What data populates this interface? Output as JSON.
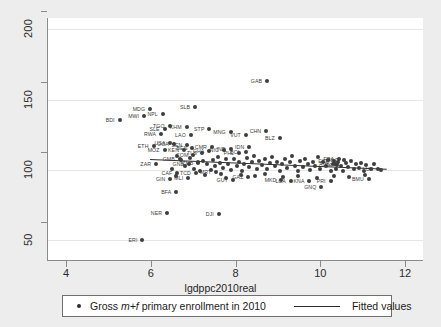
{
  "chart_data": {
    "type": "scatter",
    "title": "",
    "xlabel": "lgdppc2010real",
    "ylabel": "",
    "xlim": [
      3.55,
      12.4
    ],
    "ylim": [
      36,
      208
    ],
    "xticks": [
      4,
      6,
      8,
      10,
      12
    ],
    "yticks": [
      50,
      100,
      150,
      200
    ],
    "grid": "horizontal",
    "legend_position": "bottom",
    "series": [
      {
        "name": "Gross m+f primary enrollment in 2010",
        "marker": "filled-circle",
        "color": "#3d3d3d",
        "points": [
          {
            "label": "GAB",
            "x": 8.72,
            "y": 163.0
          },
          {
            "label": "SLB",
            "x": 7.02,
            "y": 144.5
          },
          {
            "label": "MDG",
            "x": 5.96,
            "y": 143.5
          },
          {
            "label": "NPL",
            "x": 6.26,
            "y": 140.0
          },
          {
            "label": "MWI",
            "x": 5.82,
            "y": 138.5
          },
          {
            "label": "BDI",
            "x": 5.24,
            "y": 135.5
          },
          {
            "label": "TGO",
            "x": 6.42,
            "y": 131.5
          },
          {
            "label": "KHM",
            "x": 6.82,
            "y": 130.5
          },
          {
            "label": "SLE",
            "x": 6.3,
            "y": 129.0
          },
          {
            "label": "STP",
            "x": 7.36,
            "y": 129.0
          },
          {
            "label": "MNG",
            "x": 7.86,
            "y": 127.0
          },
          {
            "label": "CHN",
            "x": 8.7,
            "y": 127.5
          },
          {
            "label": "RWA",
            "x": 6.22,
            "y": 125.5
          },
          {
            "label": "LAO",
            "x": 6.92,
            "y": 125.0
          },
          {
            "label": "VUT",
            "x": 8.22,
            "y": 124.5
          },
          {
            "label": "BLZ",
            "x": 9.02,
            "y": 123.0
          },
          {
            "label": "USA",
            "x": 6.44,
            "y": 119.0
          },
          {
            "label": "UGA",
            "x": 6.52,
            "y": 118.5
          },
          {
            "label": "MOZ",
            "x": 6.3,
            "y": 114.5
          },
          {
            "label": "KEN",
            "x": 6.76,
            "y": 114.0
          },
          {
            "label": "SEN",
            "x": 6.84,
            "y": 117.5
          },
          {
            "label": "ETH",
            "x": 6.04,
            "y": 117.0
          },
          {
            "label": "BEN",
            "x": 6.96,
            "y": 115.5
          },
          {
            "label": "CMR",
            "x": 7.42,
            "y": 116.0
          },
          {
            "label": "GHA",
            "x": 7.36,
            "y": 113.5
          },
          {
            "label": "NIC",
            "x": 7.7,
            "y": 114.5
          },
          {
            "label": "IND",
            "x": 7.86,
            "y": 115.0
          },
          {
            "label": "BOL",
            "x": 8.22,
            "y": 113.0
          },
          {
            "label": "PHL",
            "x": 8.06,
            "y": 112.0
          },
          {
            "label": "IDN",
            "x": 8.3,
            "y": 116.0
          },
          {
            "label": "TLS",
            "x": 7.18,
            "y": 112.0
          },
          {
            "label": "COM",
            "x": 6.98,
            "y": 110.5
          },
          {
            "label": "GMB",
            "x": 6.66,
            "y": 108.0
          },
          {
            "label": "GIN",
            "x": 6.44,
            "y": 93.5
          },
          {
            "label": "BFA",
            "x": 6.58,
            "y": 84.5
          },
          {
            "label": "CAF",
            "x": 6.6,
            "y": 97.5
          },
          {
            "label": "MLI",
            "x": 6.86,
            "y": 94.5
          },
          {
            "label": "ZMB",
            "x": 7.1,
            "y": 105.0
          },
          {
            "label": "ZAR",
            "x": 6.1,
            "y": 104.5
          },
          {
            "label": "TCD",
            "x": 7.04,
            "y": 97.5
          },
          {
            "label": "GNB",
            "x": 6.88,
            "y": 104.0
          },
          {
            "label": "NER",
            "x": 6.36,
            "y": 69.5
          },
          {
            "label": "DJI",
            "x": 7.58,
            "y": 68.5
          },
          {
            "label": "ERI",
            "x": 5.78,
            "y": 50.5
          },
          {
            "label": "MRT",
            "x": 7.52,
            "y": 98.5
          },
          {
            "label": "GUY",
            "x": 7.92,
            "y": 93.0
          },
          {
            "label": "GAZ",
            "x": 8.28,
            "y": 95.0
          },
          {
            "label": "MKD",
            "x": 9.06,
            "y": 93.0
          },
          {
            "label": "LCA",
            "x": 9.28,
            "y": 92.0
          },
          {
            "label": "GNQ",
            "x": 10.0,
            "y": 88.0
          },
          {
            "label": "KNA",
            "x": 9.72,
            "y": 92.5
          },
          {
            "label": "PRI",
            "x": 10.22,
            "y": 92.0
          },
          {
            "label": "BMU",
            "x": 11.12,
            "y": 93.5
          },
          {
            "label": "LUX",
            "x": 11.34,
            "y": 100.5
          },
          {
            "label": "NLD",
            "x": 10.54,
            "y": 107.0
          },
          {
            "label": "FRA",
            "x": 10.42,
            "y": 107.5
          },
          {
            "label": "AUS",
            "x": 10.32,
            "y": 104.5
          },
          {
            "label": "ITA",
            "x": 10.38,
            "y": 103.5
          },
          {
            "label": "ESP",
            "x": 10.3,
            "y": 106.5
          },
          {
            "label": "",
            "x": 7.2,
            "y": 106.5
          },
          {
            "label": "",
            "x": 7.3,
            "y": 104.0
          },
          {
            "label": "",
            "x": 7.44,
            "y": 107.0
          },
          {
            "label": "",
            "x": 7.5,
            "y": 103.0
          },
          {
            "label": "",
            "x": 7.56,
            "y": 109.0
          },
          {
            "label": "",
            "x": 7.62,
            "y": 105.0
          },
          {
            "label": "",
            "x": 7.68,
            "y": 101.5
          },
          {
            "label": "",
            "x": 7.74,
            "y": 108.0
          },
          {
            "label": "",
            "x": 7.8,
            "y": 104.0
          },
          {
            "label": "",
            "x": 7.88,
            "y": 100.0
          },
          {
            "label": "",
            "x": 7.94,
            "y": 107.5
          },
          {
            "label": "",
            "x": 8.0,
            "y": 103.0
          },
          {
            "label": "",
            "x": 8.06,
            "y": 106.0
          },
          {
            "label": "",
            "x": 8.12,
            "y": 99.5
          },
          {
            "label": "",
            "x": 8.18,
            "y": 104.5
          },
          {
            "label": "",
            "x": 8.24,
            "y": 108.5
          },
          {
            "label": "",
            "x": 8.3,
            "y": 102.0
          },
          {
            "label": "",
            "x": 8.36,
            "y": 105.5
          },
          {
            "label": "",
            "x": 8.42,
            "y": 110.0
          },
          {
            "label": "",
            "x": 8.48,
            "y": 101.0
          },
          {
            "label": "",
            "x": 8.54,
            "y": 106.5
          },
          {
            "label": "",
            "x": 8.6,
            "y": 103.5
          },
          {
            "label": "",
            "x": 8.66,
            "y": 108.0
          },
          {
            "label": "",
            "x": 8.72,
            "y": 100.5
          },
          {
            "label": "",
            "x": 8.78,
            "y": 105.0
          },
          {
            "label": "",
            "x": 8.84,
            "y": 109.5
          },
          {
            "label": "",
            "x": 8.9,
            "y": 102.5
          },
          {
            "label": "",
            "x": 8.96,
            "y": 106.0
          },
          {
            "label": "",
            "x": 9.02,
            "y": 99.0
          },
          {
            "label": "",
            "x": 9.08,
            "y": 104.0
          },
          {
            "label": "",
            "x": 9.14,
            "y": 107.5
          },
          {
            "label": "",
            "x": 9.2,
            "y": 101.5
          },
          {
            "label": "",
            "x": 9.26,
            "y": 105.5
          },
          {
            "label": "",
            "x": 9.32,
            "y": 110.0
          },
          {
            "label": "",
            "x": 9.38,
            "y": 103.0
          },
          {
            "label": "",
            "x": 9.44,
            "y": 99.5
          },
          {
            "label": "",
            "x": 9.5,
            "y": 106.5
          },
          {
            "label": "",
            "x": 9.56,
            "y": 102.0
          },
          {
            "label": "",
            "x": 9.62,
            "y": 108.0
          },
          {
            "label": "",
            "x": 9.68,
            "y": 104.5
          },
          {
            "label": "",
            "x": 9.74,
            "y": 100.0
          },
          {
            "label": "",
            "x": 9.8,
            "y": 106.0
          },
          {
            "label": "",
            "x": 9.86,
            "y": 103.0
          },
          {
            "label": "",
            "x": 9.92,
            "y": 109.0
          },
          {
            "label": "",
            "x": 9.98,
            "y": 101.0
          },
          {
            "label": "",
            "x": 10.04,
            "y": 105.5
          },
          {
            "label": "",
            "x": 10.1,
            "y": 102.5
          },
          {
            "label": "",
            "x": 10.16,
            "y": 107.0
          },
          {
            "label": "",
            "x": 10.22,
            "y": 99.5
          },
          {
            "label": "",
            "x": 10.28,
            "y": 104.0
          },
          {
            "label": "",
            "x": 10.34,
            "y": 101.0
          },
          {
            "label": "",
            "x": 10.4,
            "y": 106.0
          },
          {
            "label": "",
            "x": 10.46,
            "y": 103.0
          },
          {
            "label": "",
            "x": 10.52,
            "y": 99.0
          },
          {
            "label": "",
            "x": 10.58,
            "y": 105.0
          },
          {
            "label": "",
            "x": 10.64,
            "y": 102.0
          },
          {
            "label": "",
            "x": 10.7,
            "y": 106.5
          },
          {
            "label": "",
            "x": 10.76,
            "y": 100.5
          },
          {
            "label": "",
            "x": 10.82,
            "y": 104.0
          },
          {
            "label": "",
            "x": 10.88,
            "y": 101.5
          },
          {
            "label": "",
            "x": 10.94,
            "y": 105.0
          },
          {
            "label": "",
            "x": 11.0,
            "y": 99.0
          },
          {
            "label": "",
            "x": 11.06,
            "y": 103.5
          },
          {
            "label": "",
            "x": 11.18,
            "y": 101.0
          },
          {
            "label": "",
            "x": 11.24,
            "y": 104.5
          },
          {
            "label": "",
            "x": 11.42,
            "y": 100.0
          },
          {
            "label": "",
            "x": 6.6,
            "y": 110.0
          },
          {
            "label": "",
            "x": 6.7,
            "y": 107.0
          },
          {
            "label": "",
            "x": 6.78,
            "y": 103.0
          },
          {
            "label": "",
            "x": 6.9,
            "y": 108.5
          },
          {
            "label": "",
            "x": 7.0,
            "y": 101.0
          },
          {
            "label": "",
            "x": 7.08,
            "y": 106.0
          },
          {
            "label": "",
            "x": 6.48,
            "y": 100.5
          },
          {
            "label": "",
            "x": 6.56,
            "y": 96.0
          },
          {
            "label": "",
            "x": 7.14,
            "y": 99.0
          },
          {
            "label": "",
            "x": 7.26,
            "y": 96.5
          },
          {
            "label": "",
            "x": 7.4,
            "y": 100.0
          },
          {
            "label": "",
            "x": 7.64,
            "y": 97.0
          },
          {
            "label": "",
            "x": 7.76,
            "y": 94.0
          },
          {
            "label": "",
            "x": 8.1,
            "y": 96.5
          },
          {
            "label": "",
            "x": 8.44,
            "y": 95.5
          },
          {
            "label": "",
            "x": 8.68,
            "y": 97.0
          },
          {
            "label": "",
            "x": 9.1,
            "y": 95.0
          },
          {
            "label": "",
            "x": 9.46,
            "y": 96.0
          },
          {
            "label": "",
            "x": 9.9,
            "y": 94.5
          },
          {
            "label": "",
            "x": 10.3,
            "y": 96.0
          },
          {
            "label": "",
            "x": 10.66,
            "y": 95.0
          },
          {
            "label": "",
            "x": 11.02,
            "y": 96.5
          }
        ]
      },
      {
        "name": "Fitted values",
        "type": "line",
        "color": "#2f2f2f",
        "x_start": 5.95,
        "y_start": 107.5,
        "x_end": 11.55,
        "y_end": 100.5
      }
    ]
  },
  "legend": {
    "series_label_prefix": "Gross ",
    "series_label_italic": "m+f",
    "series_label_suffix": " primary enrollment in 2010",
    "fit_label": "Fitted values"
  },
  "colors": {
    "background": "#ededed",
    "plot_background": "#ffffff",
    "marker": "#3d3d3d",
    "gridline": "#e3e7ea",
    "axis": "#8a8a8a"
  }
}
